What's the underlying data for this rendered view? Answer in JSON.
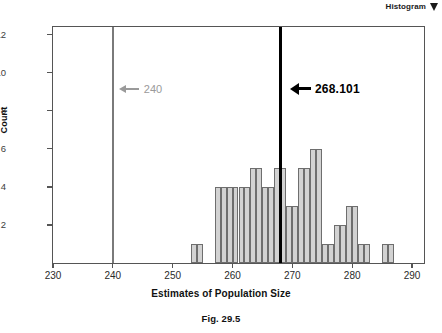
{
  "header": {
    "label": "Histogram",
    "menu_icon": "triangle-down-icon"
  },
  "figure": {
    "caption": "Fig. 29.5"
  },
  "chart_data": {
    "type": "bar",
    "title": "",
    "subtitle": "",
    "xlabel": "Estimates of Population Size",
    "ylabel": "Count",
    "xlim": [
      230,
      292
    ],
    "ylim": [
      0,
      12.4
    ],
    "grid": false,
    "legend": null,
    "bin_width": 1,
    "x_ticks": [
      230,
      240,
      250,
      260,
      270,
      280,
      290
    ],
    "x_tick_labels": [
      "230",
      "240",
      "250",
      "260",
      "270",
      "280",
      "290"
    ],
    "y_ticks": [
      2,
      4,
      6,
      8,
      10,
      12
    ],
    "y_tick_labels": [
      "2",
      "4",
      "6",
      "8",
      "10",
      "12"
    ],
    "bar_fill": "#d2d2d2",
    "bar_stroke": "#6e6e6e",
    "bins": [
      {
        "x": 253,
        "value": 1
      },
      {
        "x": 254,
        "value": 1
      },
      {
        "x": 255,
        "value": 0
      },
      {
        "x": 256,
        "value": 0
      },
      {
        "x": 257,
        "value": 4
      },
      {
        "x": 258,
        "value": 4
      },
      {
        "x": 259,
        "value": 4
      },
      {
        "x": 260,
        "value": 4
      },
      {
        "x": 261,
        "value": 4
      },
      {
        "x": 262,
        "value": 4
      },
      {
        "x": 263,
        "value": 5
      },
      {
        "x": 264,
        "value": 5
      },
      {
        "x": 265,
        "value": 4
      },
      {
        "x": 266,
        "value": 4
      },
      {
        "x": 267,
        "value": 5
      },
      {
        "x": 268,
        "value": 5
      },
      {
        "x": 269,
        "value": 3
      },
      {
        "x": 270,
        "value": 3
      },
      {
        "x": 271,
        "value": 5
      },
      {
        "x": 272,
        "value": 5
      },
      {
        "x": 273,
        "value": 6
      },
      {
        "x": 274,
        "value": 6
      },
      {
        "x": 275,
        "value": 1
      },
      {
        "x": 276,
        "value": 1
      },
      {
        "x": 277,
        "value": 2
      },
      {
        "x": 278,
        "value": 2
      },
      {
        "x": 279,
        "value": 3
      },
      {
        "x": 280,
        "value": 3
      },
      {
        "x": 281,
        "value": 1
      },
      {
        "x": 282,
        "value": 1
      },
      {
        "x": 283,
        "value": 0
      },
      {
        "x": 284,
        "value": 0
      },
      {
        "x": 285,
        "value": 1
      },
      {
        "x": 286,
        "value": 1
      }
    ],
    "reference_lines": [
      {
        "name": "true-value-line",
        "x": 240,
        "label": "240",
        "color": "#9a9a9a",
        "bold": false,
        "label_y": 9.05
      },
      {
        "name": "estimate-line",
        "x": 268.101,
        "label": "268.101",
        "color": "#000000",
        "bold": true,
        "label_y": 9.05
      }
    ]
  }
}
